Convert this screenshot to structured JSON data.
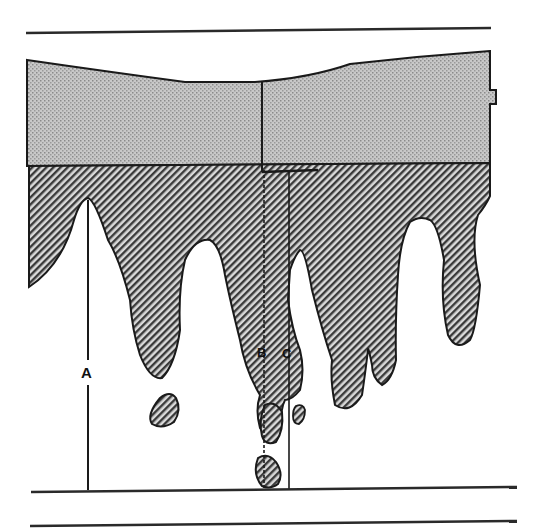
{
  "diagram": {
    "type": "cross-section profile",
    "layers": {
      "upper_layer": {
        "pattern": "stipple",
        "color": "#b9b9b9"
      },
      "lower_layer": {
        "pattern": "diagonal-hatch",
        "color": "#6e6e6e"
      }
    },
    "labels": {
      "a": "A",
      "b": "B",
      "c": "C"
    },
    "colors": {
      "line": "#1a1a1a",
      "background": "#ffffff"
    }
  }
}
